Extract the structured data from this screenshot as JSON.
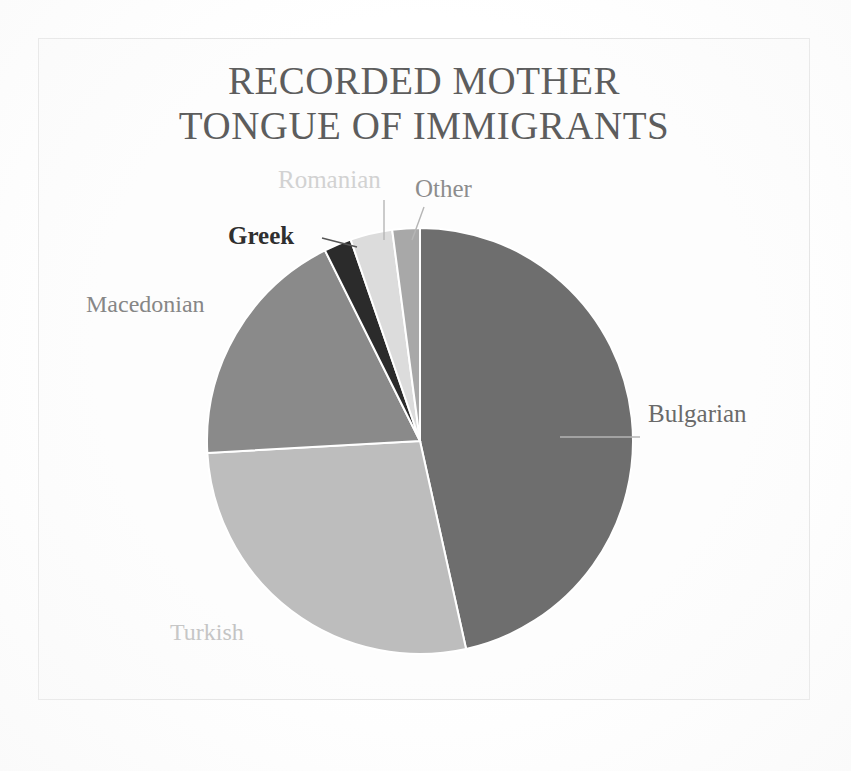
{
  "figure": {
    "title_line1": "RECORDED MOTHER",
    "title_line2": "TONGUE OF IMMIGRANTS",
    "background_color": "#ffffff",
    "frame_color": "#e3e3e3",
    "title_color": "#5d5d5d"
  },
  "chart_data": {
    "type": "pie",
    "title": "RECORDED MOTHER TONGUE OF IMMIGRANTS",
    "xlabel": "",
    "ylabel": "",
    "legend_position": "none",
    "labels_position": "outside-callout",
    "grid": false,
    "start_angle_deg": 0,
    "direction": "clockwise",
    "categories": [
      "Bulgarian",
      "Turkish",
      "Macedonian",
      "Greek",
      "Romanian",
      "Other"
    ],
    "values": [
      46.5,
      27.6,
      18.5,
      2.1,
      3.2,
      2.1
    ],
    "units": "percent",
    "slices": [
      {
        "label": "Bulgarian",
        "value": 46.5,
        "start_deg": 0.0,
        "end_deg": 167.5,
        "color": "#6e6e6e",
        "label_color": "#6a6a6a",
        "label_weight": "normal",
        "has_leader_line": true
      },
      {
        "label": "Turkish",
        "value": 27.6,
        "start_deg": 167.5,
        "end_deg": 266.8,
        "color": "#bdbdbd",
        "label_color": "#c2c2c2",
        "label_weight": "normal",
        "has_leader_line": false
      },
      {
        "label": "Macedonian",
        "value": 18.5,
        "start_deg": 266.8,
        "end_deg": 333.5,
        "color": "#8a8a8a",
        "label_color": "#868686",
        "label_weight": "normal",
        "has_leader_line": false
      },
      {
        "label": "Greek",
        "value": 2.1,
        "start_deg": 333.5,
        "end_deg": 341.0,
        "color": "#2b2b2b",
        "label_color": "#2f2f2f",
        "label_weight": "bold",
        "has_leader_line": true
      },
      {
        "label": "Romanian",
        "value": 3.2,
        "start_deg": 341.0,
        "end_deg": 352.5,
        "color": "#dcdcdc",
        "label_color": "#d2d2d2",
        "label_weight": "normal",
        "has_leader_line": true
      },
      {
        "label": "Other",
        "value": 2.1,
        "start_deg": 352.5,
        "end_deg": 360.0,
        "color": "#a8a8a8",
        "label_color": "#8d8d8d",
        "label_weight": "normal",
        "has_leader_line": true
      }
    ],
    "geometry": {
      "center_x": 420,
      "center_y": 441,
      "radius": 213,
      "separator_color": "#ffffff"
    }
  },
  "labels": {
    "bulgarian": "Bulgarian",
    "turkish": "Turkish",
    "macedonian": "Macedonian",
    "greek": "Greek",
    "romanian": "Romanian",
    "other": "Other"
  }
}
